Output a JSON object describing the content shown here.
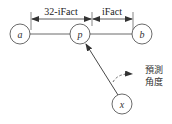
{
  "diagram": {
    "nodes": {
      "a": {
        "label": "a",
        "cx": 20,
        "cy": 34
      },
      "p": {
        "label": "p",
        "cx": 80,
        "cy": 34
      },
      "b": {
        "label": "b",
        "cx": 142,
        "cy": 34
      },
      "x": {
        "label": "x",
        "cx": 122,
        "cy": 104
      }
    },
    "dimensions": {
      "left_label": "32-iFact",
      "right_label": "iFact"
    },
    "annotation": {
      "line1": "預測",
      "line2": "角度"
    },
    "colors": {
      "stroke": "#333333",
      "background": "#ffffff"
    }
  }
}
